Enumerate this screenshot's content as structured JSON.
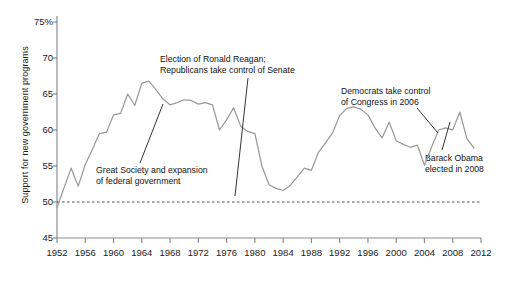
{
  "chart_data": {
    "type": "line",
    "title": "",
    "xlabel": "",
    "ylabel": "Support for new government programs",
    "ylim": [
      45,
      75
    ],
    "xlim": [
      1952,
      2012
    ],
    "grid": false,
    "legend": "none",
    "yticks": [
      "45",
      "50",
      "55",
      "60",
      "65",
      "70",
      "75%"
    ],
    "ytick_values": [
      45,
      50,
      55,
      60,
      65,
      70,
      75
    ],
    "xticks": [
      "1952",
      "1956",
      "1960",
      "1964",
      "1968",
      "1972",
      "1976",
      "1980",
      "1984",
      "1988",
      "1992",
      "1996",
      "2000",
      "2004",
      "2008",
      "2012"
    ],
    "xtick_values": [
      1952,
      1956,
      1960,
      1964,
      1968,
      1972,
      1976,
      1980,
      1984,
      1988,
      1992,
      1996,
      2000,
      2004,
      2008,
      2012
    ],
    "reference_line": {
      "value": 50,
      "style": "dashed"
    },
    "series": [
      {
        "name": "Support for new government programs",
        "color": "#9a9a9a",
        "x": [
          1952,
          1953,
          1954,
          1955,
          1956,
          1957,
          1958,
          1959,
          1960,
          1961,
          1962,
          1963,
          1964,
          1965,
          1966,
          1967,
          1968,
          1969,
          1970,
          1971,
          1972,
          1973,
          1974,
          1975,
          1976,
          1977,
          1978,
          1979,
          1980,
          1981,
          1982,
          1983,
          1984,
          1985,
          1986,
          1987,
          1988,
          1989,
          1990,
          1991,
          1992,
          1993,
          1994,
          1995,
          1996,
          1997,
          1998,
          1999,
          2000,
          2001,
          2002,
          2003,
          2004,
          2005,
          2006,
          2007,
          2008,
          2009,
          2010,
          2011,
          2012
        ],
        "values": [
          49.2,
          52.0,
          54.7,
          52.2,
          55.2,
          57.3,
          59.5,
          59.7,
          62.1,
          62.3,
          65.0,
          63.4,
          66.5,
          66.8,
          65.6,
          64.3,
          63.5,
          63.8,
          64.2,
          64.1,
          63.6,
          63.8,
          63.5,
          60.0,
          61.4,
          63.1,
          60.5,
          59.8,
          59.5,
          55.0,
          52.4,
          51.9,
          51.6,
          52.3,
          53.5,
          54.7,
          54.4,
          56.9,
          58.2,
          59.6,
          62.0,
          63.0,
          63.2,
          62.9,
          62.1,
          60.3,
          58.9,
          61.1,
          58.5,
          58.0,
          57.6,
          57.9,
          55.1,
          57.6,
          60.0,
          60.3,
          60.0,
          62.5,
          58.8,
          57.5,
          null
        ]
      }
    ],
    "annotations": [
      {
        "id": "great-society",
        "lines": [
          "Great Society and expansion",
          "of federal government"
        ],
        "text_x": 96,
        "text_y": 165,
        "leader": {
          "x1": 140,
          "y1": 163,
          "x2": 163,
          "y2": 104
        }
      },
      {
        "id": "reagan-election",
        "lines": [
          "Election of Ronald Reagan;",
          "Republicans take control of Senate"
        ],
        "text_x": 160,
        "text_y": 54,
        "leader": {
          "x1": 248,
          "y1": 78,
          "x2": 235,
          "y2": 196
        }
      },
      {
        "id": "democrats-congress-2006",
        "lines": [
          "Democrats take control",
          "of Congress in 2006"
        ],
        "text_x": 341,
        "text_y": 86,
        "leader": {
          "x1": 417,
          "y1": 108,
          "x2": 438,
          "y2": 133
        }
      },
      {
        "id": "obama-elected-2008",
        "lines": [
          "Barack Obama",
          "elected in 2008"
        ],
        "text_x": 425,
        "text_y": 153,
        "leader": {
          "x1": 442,
          "y1": 150,
          "x2": 450,
          "y2": 122
        }
      }
    ]
  }
}
